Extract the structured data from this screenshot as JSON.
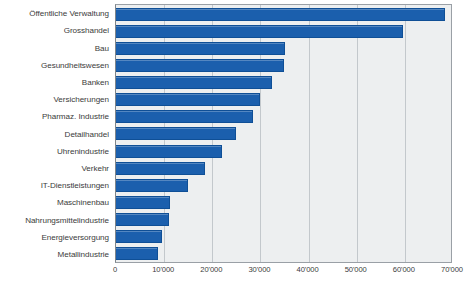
{
  "chart_data": {
    "type": "bar",
    "orientation": "horizontal",
    "title": "",
    "subtitle": "",
    "xlabel": "",
    "ylabel": "",
    "xlim": [
      0,
      70000
    ],
    "grid": "vertical",
    "legend": "none",
    "tick_labels": [
      "0",
      "10'000",
      "20'000",
      "30'000",
      "40'000",
      "50'000",
      "60'000",
      "70'000"
    ],
    "ticks": [
      0,
      10000,
      20000,
      30000,
      40000,
      50000,
      60000,
      70000
    ],
    "categories": [
      "Öffentliche Verwaltung",
      "Grosshandel",
      "Bau",
      "Gesundheitswesen",
      "Banken",
      "Versicherungen",
      "Pharmaz. Industrie",
      "Detailhandel",
      "Uhrenindustrie",
      "Verkehr",
      "IT-Dienstleistungen",
      "Maschinenbau",
      "Nahrungsmittelindustrie",
      "Energieversorgung",
      "Metallindustrie"
    ],
    "values": [
      68300,
      59600,
      35000,
      34800,
      32500,
      30000,
      28500,
      25000,
      22100,
      18500,
      15000,
      11300,
      11100,
      9600,
      8750
    ],
    "colors": {
      "bar": "#1b5fad",
      "bar_border": "#0f4f96",
      "plot_background": "#edeff0",
      "gridline": "#c3c8cc",
      "frame": "#9aa0a6",
      "text": "#3b3b3b",
      "page_background": "#ffffff"
    }
  }
}
